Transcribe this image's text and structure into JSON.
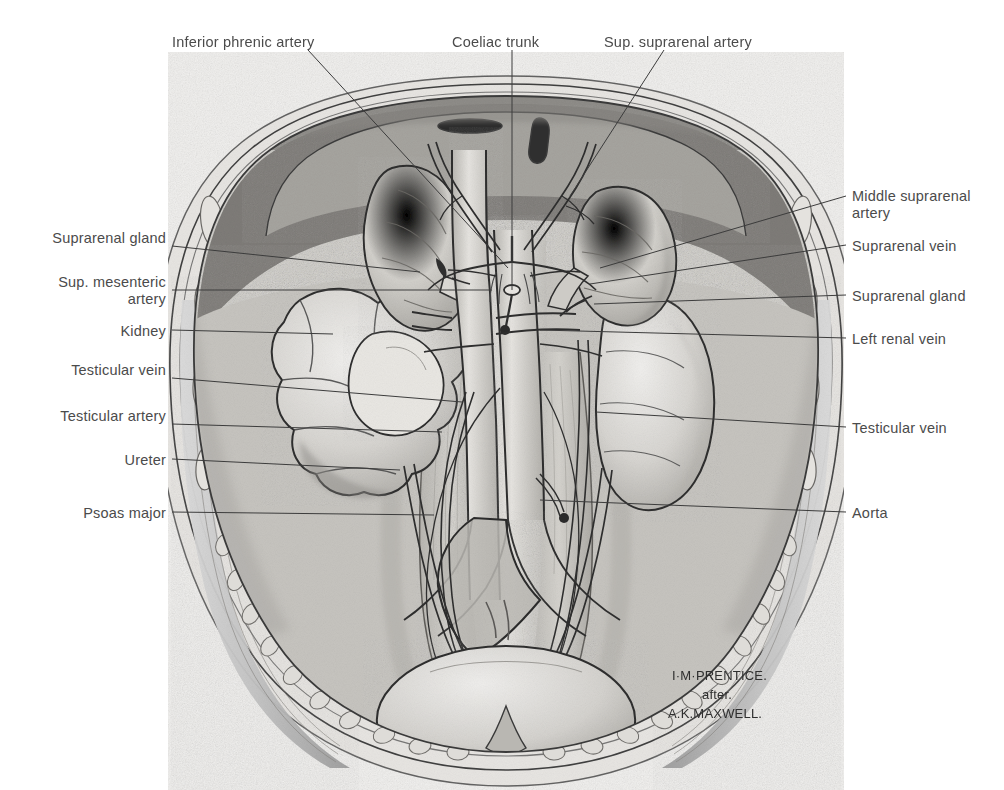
{
  "plate": {
    "title": "Posterior abdominal wall: suprarenal glands, kidneys and great vessels",
    "panel": {
      "x": 168,
      "y": 52,
      "width": 676,
      "height": 738
    },
    "paper_color": "#ffffff",
    "label_color": "#4b4b4b",
    "leader_color": "#3c3c3c",
    "ink_color": "#2b2b2b"
  },
  "credit": {
    "artist": "I·M·PRENTICE.",
    "connector": "after.",
    "source": "A.K.MAXWELL."
  },
  "labels_top": [
    {
      "id": "inferior-phrenic-artery",
      "text": "Inferior phrenic artery",
      "tx": 172,
      "ty": 34,
      "lx": 308,
      "ly": 50,
      "ex": 508,
      "ey": 268
    },
    {
      "id": "coeliac-trunk",
      "text": "Coeliac trunk",
      "tx": 452,
      "ty": 34,
      "lx": 512,
      "ly": 50,
      "ex": 512,
      "ey": 290
    },
    {
      "id": "sup-suprarenal-artery",
      "text": "Sup. suprarenal artery",
      "tx": 604,
      "ty": 34,
      "lx": 664,
      "ly": 50,
      "ex": 570,
      "ey": 196
    }
  ],
  "labels_left": [
    {
      "id": "suprarenal-gland-right",
      "text": "Suprarenal gland",
      "tx": 20,
      "ty": 230,
      "w": 146,
      "lines": 2,
      "lx": 172,
      "ly": 246,
      "ex": 420,
      "ey": 272
    },
    {
      "id": "sup-mesenteric-artery",
      "text": "Sup. mesenteric artery",
      "tx": 20,
      "ty": 274,
      "w": 146,
      "lines": 2,
      "lx": 172,
      "ly": 290,
      "ex": 492,
      "ey": 290
    },
    {
      "id": "kidney-right",
      "text": "Kidney",
      "tx": 20,
      "ty": 323,
      "w": 146,
      "lines": 1,
      "lx": 172,
      "ly": 330,
      "ex": 333,
      "ey": 334
    },
    {
      "id": "testicular-vein-left-side",
      "text": "Testicular vein",
      "tx": 20,
      "ty": 362,
      "w": 146,
      "lines": 2,
      "lx": 172,
      "ly": 378,
      "ex": 462,
      "ey": 402
    },
    {
      "id": "testicular-artery",
      "text": "Testicular artery",
      "tx": 20,
      "ty": 408,
      "w": 146,
      "lines": 2,
      "lx": 172,
      "ly": 424,
      "ex": 442,
      "ey": 432
    },
    {
      "id": "ureter",
      "text": "Ureter",
      "tx": 20,
      "ty": 452,
      "w": 146,
      "lines": 1,
      "lx": 172,
      "ly": 459,
      "ex": 400,
      "ey": 470
    },
    {
      "id": "psoas-major",
      "text": "Psoas major",
      "tx": 20,
      "ty": 505,
      "w": 146,
      "lines": 1,
      "lx": 172,
      "ly": 512,
      "ex": 434,
      "ey": 515
    }
  ],
  "labels_right": [
    {
      "id": "middle-suprarenal-artery",
      "text": "Middle suprarenal artery",
      "tx": 852,
      "ty": 188,
      "w": 150,
      "lines": 2,
      "lx": 846,
      "ly": 196,
      "ex": 600,
      "ey": 268
    },
    {
      "id": "suprarenal-vein",
      "text": "Suprarenal vein",
      "tx": 852,
      "ty": 238,
      "w": 150,
      "lines": 1,
      "lx": 846,
      "ly": 245,
      "ex": 590,
      "ey": 284
    },
    {
      "id": "suprarenal-gland-left",
      "text": "Suprarenal gland",
      "tx": 852,
      "ty": 288,
      "w": 150,
      "lines": 1,
      "lx": 846,
      "ly": 295,
      "ex": 594,
      "ey": 304
    },
    {
      "id": "left-renal-vein",
      "text": "Left renal vein",
      "tx": 852,
      "ty": 331,
      "w": 150,
      "lines": 1,
      "lx": 846,
      "ly": 338,
      "ex": 540,
      "ey": 330
    },
    {
      "id": "testicular-vein-right-side",
      "text": "Testicular vein",
      "tx": 852,
      "ty": 420,
      "w": 150,
      "lines": 1,
      "lx": 846,
      "ly": 427,
      "ex": 596,
      "ey": 412
    },
    {
      "id": "aorta",
      "text": "Aorta",
      "tx": 852,
      "ty": 505,
      "w": 150,
      "lines": 1,
      "lx": 846,
      "ly": 512,
      "ex": 540,
      "ey": 500
    }
  ]
}
